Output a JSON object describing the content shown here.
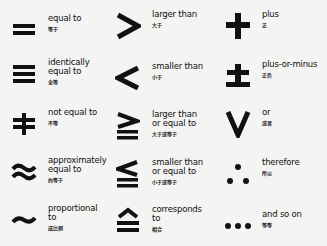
{
  "symbols": [
    {
      "id": "equal",
      "symbol": "=",
      "icon": "equals-icon",
      "label": "equal to",
      "chinese": "等于"
    },
    {
      "id": "identical",
      "symbol": "≡",
      "icon": "identical-icon",
      "label": "identically\nequal to",
      "chinese": "全等"
    },
    {
      "id": "not-equal",
      "symbol": "≠",
      "icon": "not-equal-icon",
      "label": "not equal to",
      "chinese": "不等"
    },
    {
      "id": "approx",
      "symbol": "≈",
      "icon": "approx-icon",
      "label": "approximately\nequal to",
      "chinese": "约等于"
    },
    {
      "id": "proportional",
      "symbol": "~",
      "icon": "tilde-icon",
      "label": "proportional\nto",
      "chinese": "成比例"
    },
    {
      "id": "greater",
      "symbol": ">",
      "icon": "greater-than-icon",
      "label": "larger than",
      "chinese": "大于"
    },
    {
      "id": "less",
      "symbol": "<",
      "icon": "less-than-icon",
      "label": "smaller than",
      "chinese": "小于"
    },
    {
      "id": "geq",
      "symbol": "≧",
      "icon": "greater-equal-icon",
      "label": "larger than\nor equal to",
      "chinese": "大于或等于"
    },
    {
      "id": "leq",
      "symbol": "≦",
      "icon": "less-equal-icon",
      "label": "smaller than\nor equal to",
      "chinese": "小于或等于"
    },
    {
      "id": "corresponds",
      "symbol": "≙",
      "icon": "corresponds-icon",
      "label": "corresponds\nto",
      "chinese": "相合"
    },
    {
      "id": "plus",
      "symbol": "+",
      "icon": "plus-icon",
      "label": "plus",
      "chinese": "正"
    },
    {
      "id": "plusminus",
      "symbol": "±",
      "icon": "plus-minus-icon",
      "label": "plus-or-minus",
      "chinese": "正负"
    },
    {
      "id": "or",
      "symbol": "∨",
      "icon": "or-icon",
      "label": "or",
      "chinese": "或者"
    },
    {
      "id": "therefore",
      "symbol": "∴",
      "icon": "therefore-icon",
      "label": "therefore",
      "chinese": "所以"
    },
    {
      "id": "etc",
      "symbol": "…",
      "icon": "ellipsis-icon",
      "label": "and so on",
      "chinese": "等等"
    }
  ]
}
